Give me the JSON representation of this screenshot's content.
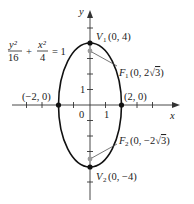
{
  "equation": {
    "num1": "y²",
    "den1": "16",
    "plus": "+",
    "num2": "x²",
    "den2": "4",
    "rhs": "= 1"
  },
  "axes": {
    "x_label": "x",
    "y_label": "y",
    "origin_label": "0",
    "x_tick_label": "1",
    "y_tick_label": "1"
  },
  "points": {
    "v1": {
      "name": "V",
      "sub": "1",
      "coords": "(0, 4)"
    },
    "v2": {
      "name": "V",
      "sub": "2",
      "coords": "(0, −4)"
    },
    "f1": {
      "name": "F",
      "sub": "1",
      "coords_pre": "(0, 2",
      "radical": "√",
      "radicand": "3",
      "coords_post": ")"
    },
    "f2": {
      "name": "F",
      "sub": "2",
      "coords_pre": "(0, −2",
      "radical": "√",
      "radicand": "3",
      "coords_post": ")"
    },
    "left": {
      "coords": "(−2, 0)"
    },
    "right": {
      "coords": "(2, 0)"
    }
  },
  "colors": {
    "curve": "#111111",
    "focus": "#9a9a9a",
    "axis": "#333333"
  }
}
